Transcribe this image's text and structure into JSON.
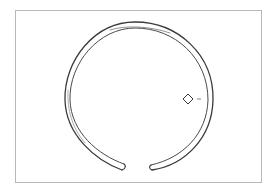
{
  "figure": {
    "type": "archaeological-illustration",
    "frame_color": "#b8b8b8",
    "line_color": "#3a3a3a",
    "cross_section": {
      "shape": "diamond",
      "center": [
        188,
        99
      ]
    }
  }
}
